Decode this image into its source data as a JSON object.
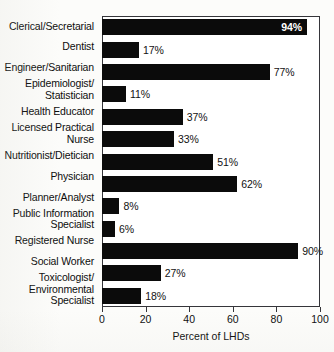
{
  "chart_data": {
    "type": "bar",
    "orientation": "horizontal",
    "title": "",
    "xlabel": "Percent of LHDs",
    "ylabel": "",
    "xlim": [
      0,
      100
    ],
    "xticks": [
      0,
      20,
      40,
      60,
      80,
      100
    ],
    "grid": false,
    "legend": null,
    "bar_color": "#0b0b0b",
    "categories": [
      "Clerical/Secretarial",
      "Dentist",
      "Engineer/Sanitarian",
      "Epidemiologist/\nStatistician",
      "Health Educator",
      "Licensed Practical\nNurse",
      "Nutritionist/Dietician",
      "Physician",
      "Planner/Analyst",
      "Public Information\nSpecialist",
      "Registered Nurse",
      "Social Worker",
      "Toxicologist/\nEnvironmental\nSpecialist"
    ],
    "values": [
      94,
      17,
      77,
      11,
      37,
      33,
      51,
      62,
      8,
      6,
      90,
      27,
      18
    ],
    "data_labels": [
      "94%",
      "17%",
      "77%",
      "11%",
      "37%",
      "33%",
      "51%",
      "62%",
      "8%",
      "6%",
      "90%",
      "27%",
      "18%"
    ],
    "label_placement": [
      "inside",
      "outside",
      "outside",
      "outside",
      "outside",
      "outside",
      "outside",
      "outside",
      "outside",
      "outside",
      "outside",
      "outside",
      "outside"
    ]
  },
  "axis": {
    "x_title": "Percent of LHDs",
    "tick_labels": [
      "0",
      "20",
      "40",
      "60",
      "80",
      "100"
    ]
  },
  "rows": [
    {
      "label": "Clerical/Secretarial",
      "value": 94,
      "data_label": "94%",
      "placement": "inside"
    },
    {
      "label": "Dentist",
      "value": 17,
      "data_label": "17%",
      "placement": "outside"
    },
    {
      "label": "Engineer/Sanitarian",
      "value": 77,
      "data_label": "77%",
      "placement": "outside"
    },
    {
      "label": "Epidemiologist/ Statistician",
      "value": 11,
      "data_label": "11%",
      "placement": "outside"
    },
    {
      "label": "Health Educator",
      "value": 37,
      "data_label": "37%",
      "placement": "outside"
    },
    {
      "label": "Licensed Practical Nurse",
      "value": 33,
      "data_label": "33%",
      "placement": "outside"
    },
    {
      "label": "Nutritionist/Dietician",
      "value": 51,
      "data_label": "51%",
      "placement": "outside"
    },
    {
      "label": "Physician",
      "value": 62,
      "data_label": "62%",
      "placement": "outside"
    },
    {
      "label": "Planner/Analyst",
      "value": 8,
      "data_label": "8%",
      "placement": "outside"
    },
    {
      "label": "Public Information Specialist",
      "value": 6,
      "data_label": "6%",
      "placement": "outside"
    },
    {
      "label": "Registered Nurse",
      "value": 90,
      "data_label": "90%",
      "placement": "outside"
    },
    {
      "label": "Social Worker",
      "value": 27,
      "data_label": "27%",
      "placement": "outside"
    },
    {
      "label": "Toxicologist/ Environmental Specialist",
      "value": 18,
      "data_label": "18%",
      "placement": "outside"
    }
  ]
}
